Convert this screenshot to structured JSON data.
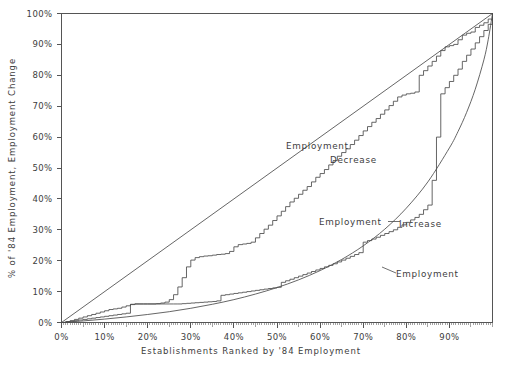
{
  "chart_data": {
    "type": "line",
    "title": "",
    "subtitle": "",
    "xlabel": "Establishments Ranked by '84 Employment",
    "ylabel": "% of '84 Employment, Employment Change",
    "xlim": [
      0,
      100
    ],
    "ylim": [
      0,
      100
    ],
    "grid": false,
    "legend_position": "inline-annotations",
    "xticks": [
      "0%",
      "10%",
      "20%",
      "30%",
      "40%",
      "50%",
      "60%",
      "70%",
      "80%",
      "90%"
    ],
    "xtick_values": [
      0,
      10,
      20,
      30,
      40,
      50,
      60,
      70,
      80,
      90
    ],
    "yticks": [
      "0%",
      "10%",
      "20%",
      "30%",
      "40%",
      "50%",
      "60%",
      "70%",
      "80%",
      "90%",
      "100%"
    ],
    "ytick_values": [
      0,
      10,
      20,
      30,
      40,
      50,
      60,
      70,
      80,
      90,
      100
    ],
    "minor_ticks_axis": "x",
    "annotations": [
      {
        "id": "employment-diagonal",
        "text": "Employment",
        "x_pct": 52.0,
        "y_pct": 48.0
      },
      {
        "id": "employment-decrease",
        "text": "Decrease",
        "x_pct": 63.5,
        "y_pct": 43.0
      },
      {
        "id": "employment-increase-a",
        "text": "Employment",
        "x_pct": 61.5,
        "y_pct": 26.0
      },
      {
        "id": "employment-increase-b",
        "text": "Increase",
        "x_pct": 79.0,
        "y_pct": 25.0
      },
      {
        "id": "employment-lower",
        "text": "Employment",
        "x_pct": 86.0,
        "y_pct": 14.0
      }
    ],
    "series": [
      {
        "name": "Employment",
        "style": "diagonal-reference",
        "x": [
          0,
          100
        ],
        "values": [
          0,
          100
        ]
      },
      {
        "name": "Employment Decrease",
        "style": "step",
        "x": [
          0,
          1,
          2,
          3,
          4,
          5,
          6,
          7,
          8,
          9,
          10,
          11,
          12,
          13,
          14,
          15,
          16,
          17,
          18,
          19,
          20,
          21,
          22,
          23,
          24,
          25,
          26,
          27,
          28,
          29,
          30,
          31,
          32,
          33,
          34,
          35,
          36,
          37,
          38,
          39,
          40,
          41,
          42,
          43,
          44,
          45,
          46,
          47,
          48,
          49,
          50,
          51,
          52,
          53,
          54,
          55,
          56,
          57,
          58,
          59,
          60,
          61,
          62,
          63,
          64,
          65,
          66,
          67,
          68,
          69,
          70,
          71,
          72,
          73,
          74,
          75,
          76,
          77,
          78,
          79,
          80,
          81,
          82,
          83,
          84,
          85,
          86,
          87,
          88,
          89,
          90,
          91,
          92,
          93,
          94,
          95,
          96,
          97,
          98,
          99,
          100
        ],
        "values": [
          0,
          0.3,
          0.6,
          1.0,
          1.4,
          1.8,
          2.2,
          2.6,
          3.0,
          3.4,
          3.8,
          4.2,
          4.4,
          4.6,
          5.0,
          5.4,
          5.8,
          6.0,
          6.0,
          6.0,
          6.0,
          6.0,
          6.1,
          6.3,
          6.6,
          7.4,
          9.0,
          11.5,
          14.5,
          18.0,
          20.2,
          21.0,
          21.3,
          21.5,
          21.6,
          21.8,
          22.0,
          22.1,
          22.3,
          23.0,
          24.5,
          25.2,
          25.4,
          25.6,
          26.0,
          27.4,
          28.8,
          30.2,
          31.5,
          33.0,
          34.5,
          36.0,
          37.5,
          39.0,
          40.2,
          41.5,
          42.8,
          44.0,
          45.5,
          47.0,
          48.2,
          49.5,
          51.0,
          52.4,
          53.8,
          55.0,
          56.2,
          57.6,
          59.0,
          60.5,
          62.0,
          63.4,
          64.8,
          66.0,
          67.4,
          68.8,
          70.2,
          71.6,
          73.0,
          73.6,
          74.0,
          74.2,
          74.6,
          80.0,
          81.5,
          83.0,
          84.5,
          86.2,
          88.0,
          89.2,
          89.6,
          90.0,
          91.5,
          93.0,
          93.6,
          94.0,
          95.5,
          96.2,
          97.0,
          98.2,
          100
        ]
      },
      {
        "name": "Employment Increase",
        "style": "step",
        "x": [
          0,
          1,
          2,
          3,
          4,
          5,
          6,
          7,
          8,
          9,
          10,
          11,
          12,
          13,
          14,
          15,
          16,
          17,
          18,
          19,
          20,
          21,
          22,
          23,
          24,
          25,
          26,
          27,
          28,
          29,
          30,
          31,
          32,
          33,
          34,
          35,
          36,
          37,
          38,
          39,
          40,
          41,
          42,
          43,
          44,
          45,
          46,
          47,
          48,
          49,
          50,
          51,
          52,
          53,
          54,
          55,
          56,
          57,
          58,
          59,
          60,
          61,
          62,
          63,
          64,
          65,
          66,
          67,
          68,
          69,
          70,
          71,
          72,
          73,
          74,
          75,
          76,
          77,
          78,
          79,
          80,
          81,
          82,
          83,
          84,
          85,
          86,
          87,
          88,
          89,
          90,
          91,
          92,
          93,
          94,
          95,
          96,
          97,
          98,
          99,
          100
        ],
        "values": [
          0,
          0.2,
          0.4,
          0.6,
          0.8,
          1.0,
          1.2,
          1.4,
          1.6,
          1.8,
          2.0,
          2.2,
          2.4,
          2.6,
          2.8,
          3.0,
          5.9,
          6.0,
          6.0,
          6.0,
          6.0,
          6.0,
          6.0,
          6.0,
          6.0,
          6.0,
          6.0,
          6.0,
          6.1,
          6.2,
          6.3,
          6.4,
          6.5,
          6.6,
          6.7,
          6.8,
          7.0,
          8.8,
          9.0,
          9.2,
          9.4,
          9.6,
          9.8,
          10.0,
          10.2,
          10.4,
          10.6,
          10.8,
          11.0,
          11.2,
          11.4,
          13.0,
          13.5,
          14.0,
          14.5,
          15.0,
          15.5,
          16.0,
          16.5,
          17.0,
          17.5,
          18.0,
          18.5,
          19.0,
          19.6,
          20.2,
          20.8,
          21.4,
          22.0,
          22.6,
          26.0,
          26.5,
          27.0,
          27.6,
          28.2,
          28.8,
          29.4,
          30.0,
          30.8,
          31.6,
          32.4,
          33.2,
          34.0,
          35.0,
          36.5,
          38.0,
          46.0,
          60.0,
          74.0,
          76.0,
          78.0,
          80.0,
          82.0,
          84.5,
          86.5,
          88.5,
          90.5,
          92.5,
          94.5,
          96.5,
          100
        ]
      },
      {
        "name": "Employment",
        "style": "smooth-lorenz",
        "x": [
          0,
          5,
          10,
          15,
          20,
          25,
          30,
          35,
          40,
          45,
          50,
          55,
          60,
          65,
          70,
          75,
          80,
          85,
          90,
          92,
          94,
          96,
          98,
          99,
          100
        ],
        "values": [
          0,
          0.5,
          1.1,
          1.8,
          2.6,
          3.5,
          4.6,
          5.9,
          7.4,
          9.2,
          11.3,
          13.8,
          16.8,
          20.4,
          24.8,
          30.2,
          37.0,
          45.5,
          56.5,
          61.8,
          68.0,
          75.5,
          85.0,
          91.5,
          100
        ]
      }
    ]
  },
  "figure": {
    "background_color": "#ffffff",
    "axis_color": "#555555",
    "curve_color": "#4a4a4a",
    "text_color": "#3d3d3d"
  }
}
